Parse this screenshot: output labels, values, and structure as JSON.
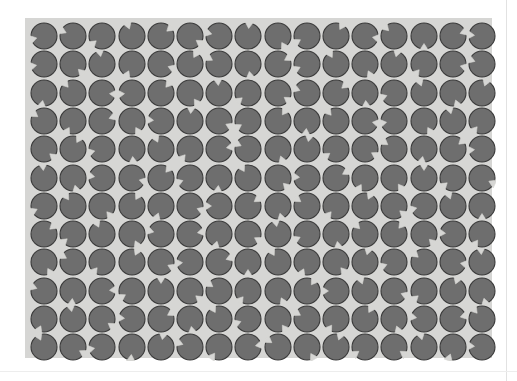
{
  "figure": {
    "kind": "psychophysics-stimulus",
    "canvas_width": 517,
    "canvas_height": 381,
    "caption": ""
  },
  "colors": {
    "page_background": "#ffffff",
    "panel_background": "#d6d6d4",
    "disc_fill": "#6e6e6e",
    "disc_edge": "#3a3a3a",
    "notch_fill": "#d6d6d4",
    "page_rule": "#e2e2e2"
  },
  "panel": {
    "x": 25,
    "y": 18,
    "width": 467,
    "height": 340
  },
  "grid": {
    "columns": 16,
    "rows": 12,
    "disc_diameter": 26,
    "cell_width": 29.2,
    "cell_height": 28.3,
    "origin_x": 5,
    "origin_y": 4,
    "notch_half_angle_deg": 17,
    "notch_depth_ratio": 0.42
  },
  "chart_data": {
    "type": "scatter",
    "xlabel": "",
    "ylabel": "",
    "categories": [],
    "values": [],
    "notch_angles_deg": [
      [
        165,
        205,
        140,
        250,
        320,
        35,
        195,
        275,
        60,
        150,
        300,
        10,
        225,
        90,
        340,
        185
      ],
      [
        170,
        45,
        260,
        115,
        20,
        300,
        210,
        80,
        330,
        155,
        240,
        65,
        285,
        130,
        15,
        200
      ],
      [
        100,
        230,
        5,
        175,
        310,
        55,
        265,
        140,
        35,
        200,
        320,
        85,
        160,
        250,
        70,
        290
      ],
      [
        215,
        120,
        340,
        60,
        185,
        275,
        25,
        150,
        305,
        95,
        230,
        10,
        170,
        60,
        255,
        130
      ],
      [
        40,
        300,
        165,
        85,
        245,
        130,
        350,
        205,
        70,
        280,
        145,
        30,
        215,
        100,
        320,
        175
      ],
      [
        265,
        75,
        190,
        15,
        310,
        160,
        95,
        240,
        45,
        185,
        330,
        120,
        55,
        270,
        140,
        25
      ],
      [
        155,
        235,
        50,
        300,
        110,
        20,
        180,
        325,
        75,
        215,
        130,
        295,
        40,
        165,
        250,
        90
      ],
      [
        320,
        140,
        245,
        65,
        195,
        350,
        105,
        30,
        260,
        155,
        80,
        225,
        310,
        45,
        185,
        125
      ],
      [
        60,
        210,
        130,
        295,
        25,
        175,
        340,
        90,
        240,
        115,
        50,
        285,
        160,
        220,
        10,
        265
      ],
      [
        200,
        95,
        355,
        150,
        270,
        40,
        215,
        130,
        65,
        305,
        180,
        250,
        20,
        140,
        290,
        75
      ],
      [
        115,
        260,
        35,
        185,
        330,
        80,
        240,
        160,
        55,
        210,
        125,
        300,
        70,
        190,
        345,
        230
      ],
      [
        245,
        30,
        170,
        95,
        280,
        200,
        125,
        350,
        215,
        60,
        290,
        145,
        35,
        255,
        110,
        185
      ]
    ],
    "grid_on": false,
    "legend": []
  }
}
